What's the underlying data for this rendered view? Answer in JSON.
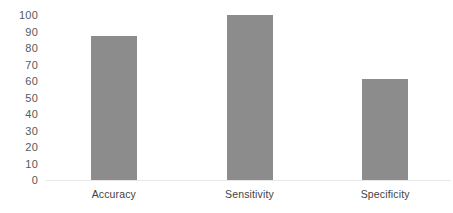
{
  "chart_data": {
    "type": "bar",
    "title": "",
    "subtitle": "",
    "xlabel": "",
    "ylabel": "",
    "categories": [
      "Accuracy",
      "Sensitivity",
      "Specificity"
    ],
    "values": [
      87,
      100,
      61
    ],
    "series": [
      {
        "name": "",
        "values": [
          87,
          100,
          61
        ],
        "color": "#8c8c8c"
      }
    ],
    "ylim": [
      0,
      100
    ],
    "ytick_labels": [
      "0",
      "10",
      "20",
      "30",
      "40",
      "50",
      "60",
      "70",
      "80",
      "90",
      "100"
    ],
    "ytick_values": [
      0,
      10,
      20,
      30,
      40,
      50,
      60,
      70,
      80,
      90,
      100
    ],
    "grid": false,
    "legend": false,
    "legend_position": "none",
    "annotations": [],
    "bar_color": "#8c8c8c",
    "axis_label_color": "#595959",
    "category_label_color": "#3f3f3f",
    "background_color": "#ffffff"
  }
}
